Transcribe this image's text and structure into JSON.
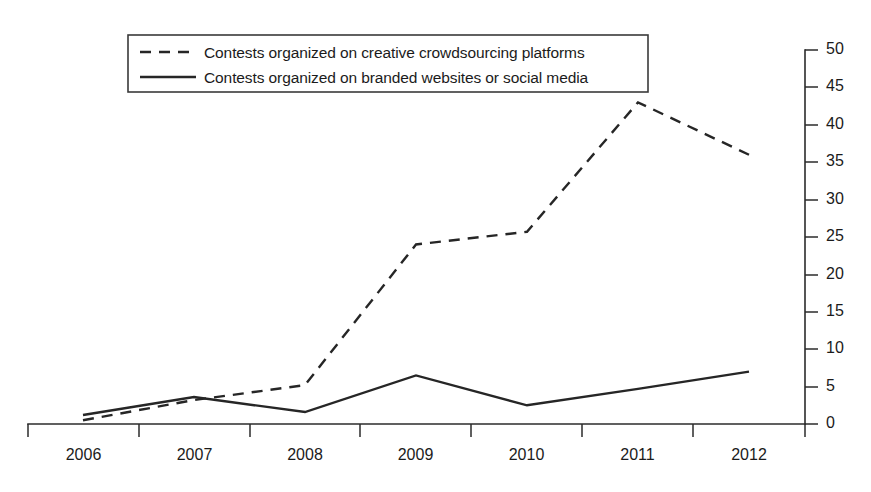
{
  "chart_data": {
    "type": "line",
    "title": "",
    "subtitle": "",
    "xlabel": "",
    "ylabel": "",
    "categories": [
      "2006",
      "2007",
      "2008",
      "2009",
      "2010",
      "2011",
      "2012"
    ],
    "ylim": [
      0,
      50
    ],
    "yticks": [
      "0",
      "5",
      "10",
      "15",
      "20",
      "25",
      "30",
      "35",
      "40",
      "45",
      "50"
    ],
    "ytick_values": [
      0,
      5,
      10,
      15,
      20,
      25,
      30,
      35,
      40,
      45,
      50
    ],
    "y_axis_position": "right",
    "grid": false,
    "legend_position": "top-left",
    "series": [
      {
        "name": "Contests organized on creative crowdsourcing platforms",
        "style": "dashed",
        "color": "#262626",
        "values": [
          0.5,
          3.2,
          5.2,
          24,
          25.7,
          43,
          36
        ]
      },
      {
        "name": "Contests organized on branded websites or social media",
        "style": "solid",
        "color": "#262626",
        "values": [
          1.2,
          3.6,
          1.6,
          6.5,
          2.5,
          4.7,
          7
        ]
      }
    ]
  },
  "legend": {
    "items": [
      {
        "label": "Contests organized on creative crowdsourcing platforms",
        "style": "dashed"
      },
      {
        "label": "Contests organized on branded websites or social media",
        "style": "solid"
      }
    ]
  },
  "axes": {
    "y_ticks": [
      "50",
      "45",
      "40",
      "35",
      "30",
      "25",
      "20",
      "15",
      "10",
      "5",
      "0"
    ],
    "x_ticks": [
      "2006",
      "2007",
      "2008",
      "2009",
      "2010",
      "2011",
      "2012"
    ]
  }
}
